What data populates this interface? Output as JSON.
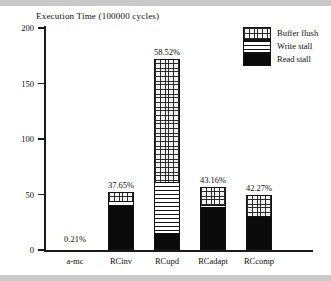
{
  "chart_data": {
    "type": "bar",
    "title": "Execution Time (100000 cycles)",
    "xlabel": "",
    "ylabel": "Execution Time (100000 cycles)",
    "ylim": [
      0,
      200
    ],
    "yticks": [
      0,
      50,
      100,
      150,
      200
    ],
    "grid": false,
    "legend_position": "top-right",
    "stacked": true,
    "categories": [
      "a-mc",
      "RCinv",
      "RCupd",
      "RCadapt",
      "RCcomp"
    ],
    "series": [
      {
        "name": "Read stall",
        "values": [
          0.0,
          39.0,
          14.0,
          38.0,
          29.0
        ]
      },
      {
        "name": "Write stall",
        "values": [
          0.0,
          4.0,
          46.0,
          2.0,
          1.0
        ]
      },
      {
        "name": "Buffer flush",
        "values": [
          0.0,
          9.0,
          112.0,
          17.0,
          20.0
        ]
      }
    ],
    "totals": [
      0.4,
      52.0,
      172.0,
      57.0,
      50.0
    ],
    "annotations": [
      "0.21%",
      "37.65%",
      "58.52%",
      "43.16%",
      "42.27%"
    ]
  },
  "legend": {
    "items": [
      {
        "label": "Buffer flush",
        "pattern": "cross-hatch",
        "color": "#f2f2f2"
      },
      {
        "label": "Write stall",
        "pattern": "horizontal-lines",
        "color": "#ffffff"
      },
      {
        "label": "Read stall",
        "pattern": "solid",
        "color": "#0a0a0a"
      }
    ]
  },
  "axis": {
    "y_tick_labels": [
      "200",
      "150",
      "100",
      "50",
      "0"
    ]
  }
}
